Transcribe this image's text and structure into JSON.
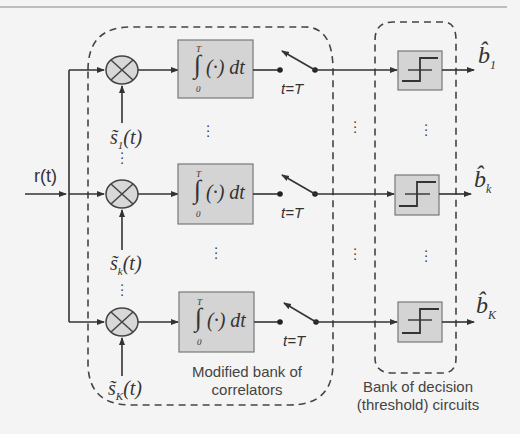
{
  "diagram": {
    "input_label": "r(t)",
    "branches": [
      {
        "id": "1",
        "reference": "s̃",
        "ref_sub": "1",
        "ref_arg": "(t)",
        "integrator_upper": "T",
        "integrator_lower": "0",
        "integrator_body": "(·) dt",
        "switch_label": "t=T",
        "output": "b̂",
        "out_sub": "1"
      },
      {
        "id": "k",
        "reference": "s̃",
        "ref_sub": "k",
        "ref_arg": "(t)",
        "integrator_upper": "T",
        "integrator_lower": "0",
        "integrator_body": "(·) dt",
        "switch_label": "t=T",
        "output": "b̂",
        "out_sub": "k"
      },
      {
        "id": "K",
        "reference": "s̃",
        "ref_sub": "K",
        "ref_arg": "(t)",
        "integrator_upper": "T",
        "integrator_lower": "0",
        "integrator_body": "(·) dt",
        "switch_label": "t=T",
        "output": "b̂",
        "out_sub": "K"
      }
    ],
    "groups": {
      "correlators": {
        "line1": "Modified bank of",
        "line2": "correlators"
      },
      "decision": {
        "line1": "Bank of decision",
        "line2": "(threshold) circuits"
      }
    },
    "ellipsis": "⋮",
    "colors": {
      "line": "#333333",
      "block_fill": "#d4d4d4",
      "block_stroke": "#777777",
      "background": "#f4f4f4",
      "dash": "#444444"
    }
  }
}
